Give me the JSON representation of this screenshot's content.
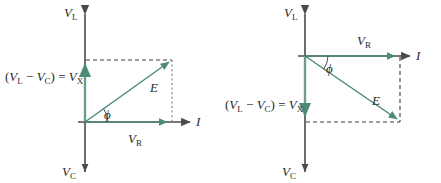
{
  "figure": {
    "background_color": "#ffffff",
    "axis_color": "#4a4a4a",
    "phasor_color": "#4d8a7a",
    "dash_color": "#3c3c3c",
    "text_color": "#2b2b2b"
  },
  "labels": {
    "v_l": "V",
    "v_l_sub": "L",
    "v_c": "V",
    "v_c_sub": "C",
    "v_r": "V",
    "v_r_sub": "R",
    "v_x": "V",
    "v_x_sub": "X",
    "current": "I",
    "emf": "E",
    "phase_angle": "ϕ",
    "equation_open": "(",
    "equation_v_l": "V",
    "equation_v_l_sub": "L",
    "equation_minus": "−",
    "equation_v_c": "V",
    "equation_v_c_sub": "C",
    "equation_close": ")",
    "equation_equals": "=",
    "equation_v_x": "V",
    "equation_v_x_sub": "X"
  },
  "diagrams": [
    {
      "id": "left",
      "name": "inductive-phasor-diagram",
      "description": "V_L greater than V_C, E leads current I by phi",
      "origin": {
        "x": 85,
        "y": 122
      },
      "axes": {
        "vertical": {
          "x": 85,
          "y_top": 8,
          "y_bottom": 172,
          "top_label": "V_L",
          "bottom_label": "V_C"
        },
        "horizontal": {
          "y": 122,
          "x_start": 78,
          "x_end": 196,
          "label": "I"
        }
      },
      "vectors": {
        "v_r": {
          "from": {
            "x": 85,
            "y": 122
          },
          "to": {
            "x": 172,
            "y": 122
          },
          "label": "V_R",
          "label_x": 140,
          "label_y": 140
        },
        "v_x": {
          "from": {
            "x": 85,
            "y": 122
          },
          "to": {
            "x": 85,
            "y": 60
          },
          "label": "V_X",
          "direction": "up"
        },
        "emf": {
          "from": {
            "x": 85,
            "y": 122
          },
          "to": {
            "x": 172,
            "y": 60
          },
          "label": "E",
          "label_x": 152,
          "label_y": 88
        }
      },
      "angle": {
        "label": "ϕ",
        "label_x": 104,
        "label_y": 118,
        "degrees": 35
      },
      "equation_label": {
        "x": 6,
        "y": 77
      }
    },
    {
      "id": "right",
      "name": "capacitive-phasor-diagram",
      "description": "V_C greater than V_L, E lags current I by phi",
      "origin": {
        "x": 85,
        "y": 56
      },
      "axes": {
        "vertical": {
          "x": 85,
          "y_top": 8,
          "y_bottom": 172,
          "top_label": "V_L",
          "bottom_label": "V_C"
        },
        "horizontal": {
          "y": 56,
          "x_start": 78,
          "x_end": 196,
          "label": "I"
        }
      },
      "vectors": {
        "v_r": {
          "from": {
            "x": 85,
            "y": 56
          },
          "to": {
            "x": 180,
            "y": 56
          },
          "label": "V_R",
          "label_x": 148,
          "label_y": 44
        },
        "v_x": {
          "from": {
            "x": 85,
            "y": 56
          },
          "to": {
            "x": 85,
            "y": 122
          },
          "label": "V_X",
          "direction": "down"
        },
        "emf": {
          "from": {
            "x": 85,
            "y": 56
          },
          "to": {
            "x": 180,
            "y": 122
          },
          "label": "E",
          "label_x": 160,
          "label_y": 100
        }
      },
      "angle": {
        "label": "ϕ",
        "label_x": 105,
        "label_y": 72,
        "degrees": -35
      },
      "equation_label": {
        "x": 6,
        "y": 105
      }
    }
  ]
}
